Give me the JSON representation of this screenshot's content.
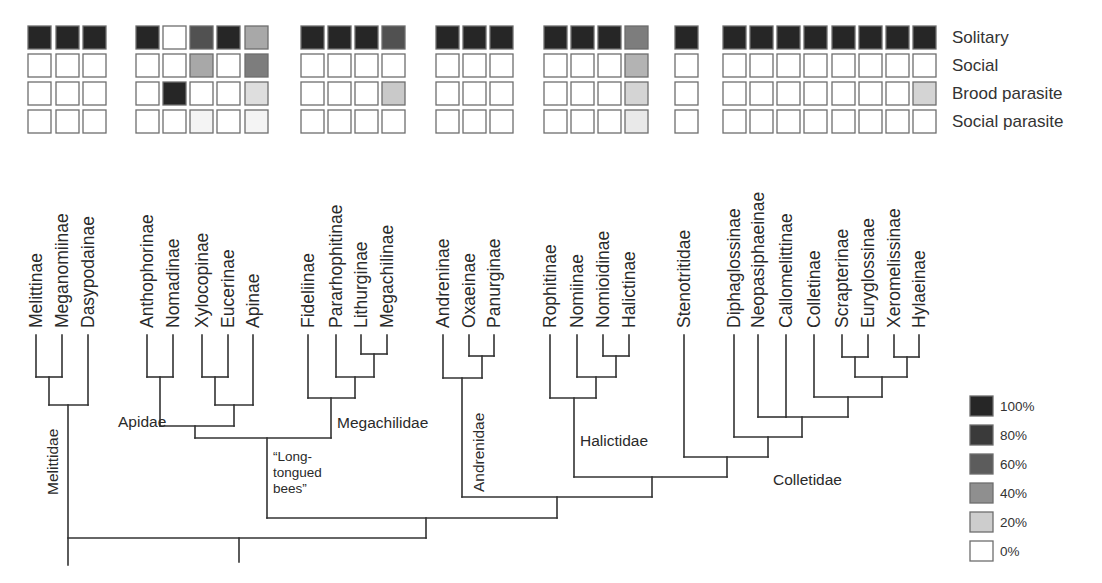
{
  "chart_data": {
    "type": "heatmap",
    "title": "",
    "rows": [
      "Solitary",
      "Social",
      "Brood parasite",
      "Social parasite"
    ],
    "legend": {
      "entries": [
        "100%",
        "80%",
        "60%",
        "40%",
        "20%",
        "0%"
      ],
      "colors": [
        "#262626",
        "#3a3a3a",
        "#5c5c5c",
        "#8f8f8f",
        "#cdcdcd",
        "#ffffff"
      ],
      "position": "bottom-right"
    },
    "columns": [
      {
        "taxon": "Melittinae",
        "family": "Melittidae",
        "values": [
          100,
          0,
          0,
          0
        ]
      },
      {
        "taxon": "Meganomiinae",
        "family": "Melittidae",
        "values": [
          100,
          0,
          0,
          0
        ]
      },
      {
        "taxon": "Dasypodainae",
        "family": "Melittidae",
        "values": [
          100,
          0,
          0,
          0
        ]
      },
      {
        "taxon": "Anthophorinae",
        "family": "Apidae",
        "values": [
          100,
          0,
          0,
          0
        ]
      },
      {
        "taxon": "Nomadinae",
        "family": "Apidae",
        "values": [
          0,
          0,
          100,
          0
        ]
      },
      {
        "taxon": "Xylocopinae",
        "family": "Apidae",
        "values": [
          80,
          40,
          0,
          5
        ]
      },
      {
        "taxon": "Eucerinae",
        "family": "Apidae",
        "values": [
          100,
          0,
          0,
          0
        ]
      },
      {
        "taxon": "Apinae",
        "family": "Apidae",
        "values": [
          40,
          60,
          15,
          5
        ]
      },
      {
        "taxon": "Fideliinae",
        "family": "Megachilidae",
        "values": [
          100,
          0,
          0,
          0
        ]
      },
      {
        "taxon": "Pararhophitinae",
        "family": "Megachilidae",
        "values": [
          100,
          0,
          0,
          0
        ]
      },
      {
        "taxon": "Lithurginae",
        "family": "Megachilidae",
        "values": [
          100,
          0,
          0,
          0
        ]
      },
      {
        "taxon": "Megachilinae",
        "family": "Megachilidae",
        "values": [
          80,
          0,
          25,
          0
        ]
      },
      {
        "taxon": "Andreninae",
        "family": "Andrenidae",
        "values": [
          100,
          0,
          0,
          0
        ]
      },
      {
        "taxon": "Oxaeinae",
        "family": "Andrenidae",
        "values": [
          100,
          0,
          0,
          0
        ]
      },
      {
        "taxon": "Panurginae",
        "family": "Andrenidae",
        "values": [
          100,
          0,
          0,
          0
        ]
      },
      {
        "taxon": "Rophitinae",
        "family": "Halictidae",
        "values": [
          100,
          0,
          0,
          0
        ]
      },
      {
        "taxon": "Nomiinae",
        "family": "Halictidae",
        "values": [
          100,
          0,
          0,
          0
        ]
      },
      {
        "taxon": "Nomioidinae",
        "family": "Halictidae",
        "values": [
          100,
          0,
          0,
          0
        ]
      },
      {
        "taxon": "Halictinae",
        "family": "Halictidae",
        "values": [
          60,
          35,
          20,
          10
        ]
      },
      {
        "taxon": "Stenotritidae",
        "family": "Stenotritidae",
        "values": [
          100,
          0,
          0,
          0
        ]
      },
      {
        "taxon": "Diphaglossinae",
        "family": "Colletidae",
        "values": [
          100,
          0,
          0,
          0
        ]
      },
      {
        "taxon": "Neopasiphaeinae",
        "family": "Colletidae",
        "values": [
          100,
          0,
          0,
          0
        ]
      },
      {
        "taxon": "Callomelittinae",
        "family": "Colletidae",
        "values": [
          100,
          0,
          0,
          0
        ]
      },
      {
        "taxon": "Colletinae",
        "family": "Colletidae",
        "values": [
          100,
          0,
          0,
          0
        ]
      },
      {
        "taxon": "Scrapterinae",
        "family": "Colletidae",
        "values": [
          100,
          0,
          0,
          0
        ]
      },
      {
        "taxon": "Euryglossinae",
        "family": "Colletidae",
        "values": [
          100,
          0,
          0,
          0
        ]
      },
      {
        "taxon": "Xeromelissinae",
        "family": "Colletidae",
        "values": [
          100,
          0,
          0,
          0
        ]
      },
      {
        "taxon": "Hylaeinae",
        "family": "Colletidae",
        "values": [
          100,
          0,
          20,
          0
        ]
      }
    ]
  },
  "layout": {
    "cell_size": 23,
    "row_y": [
      26,
      54,
      82,
      110
    ],
    "col_x": [
      28,
      56,
      83,
      136,
      163,
      190,
      217,
      245,
      301,
      328,
      355,
      382,
      436,
      463,
      490,
      544,
      571,
      598,
      625,
      675,
      723,
      750,
      777,
      804,
      832,
      859,
      886,
      913
    ],
    "tip_x": [
      36,
      62,
      88,
      147,
      173,
      202,
      228,
      253,
      308,
      336,
      361,
      387,
      443,
      469,
      494,
      550,
      577,
      603,
      629,
      684,
      734,
      758,
      786,
      814,
      842,
      868,
      894,
      919
    ],
    "tip_label_bottom_y": 328,
    "tip_top_y": 335,
    "row_label_x": 952
  },
  "tree": {
    "segments": [
      [
        36,
        335,
        36,
        377
      ],
      [
        62,
        335,
        62,
        377
      ],
      [
        36,
        377,
        62,
        377
      ],
      [
        49,
        377,
        49,
        405
      ],
      [
        88,
        335,
        88,
        405
      ],
      [
        49,
        405,
        88,
        405
      ],
      [
        68,
        405,
        68,
        565
      ],
      [
        147,
        335,
        147,
        377
      ],
      [
        173,
        335,
        173,
        377
      ],
      [
        147,
        377,
        173,
        377
      ],
      [
        160,
        377,
        160,
        426
      ],
      [
        202,
        335,
        202,
        377
      ],
      [
        228,
        335,
        228,
        377
      ],
      [
        202,
        377,
        228,
        377
      ],
      [
        215,
        377,
        215,
        405
      ],
      [
        253,
        335,
        253,
        405
      ],
      [
        215,
        405,
        253,
        405
      ],
      [
        234,
        405,
        234,
        426
      ],
      [
        160,
        426,
        234,
        426
      ],
      [
        195,
        426,
        195,
        438
      ],
      [
        308,
        335,
        308,
        398
      ],
      [
        336,
        335,
        336,
        377
      ],
      [
        361,
        335,
        361,
        354
      ],
      [
        387,
        335,
        387,
        354
      ],
      [
        361,
        354,
        387,
        354
      ],
      [
        374,
        354,
        374,
        377
      ],
      [
        336,
        377,
        374,
        377
      ],
      [
        355,
        377,
        355,
        398
      ],
      [
        308,
        398,
        355,
        398
      ],
      [
        331,
        398,
        331,
        438
      ],
      [
        195,
        438,
        331,
        438
      ],
      [
        267,
        438,
        267,
        518
      ],
      [
        443,
        335,
        443,
        378
      ],
      [
        469,
        335,
        469,
        356
      ],
      [
        494,
        335,
        494,
        356
      ],
      [
        469,
        356,
        494,
        356
      ],
      [
        482,
        356,
        482,
        378
      ],
      [
        443,
        378,
        482,
        378
      ],
      [
        462,
        378,
        462,
        497
      ],
      [
        550,
        335,
        550,
        398
      ],
      [
        577,
        335,
        577,
        377
      ],
      [
        603,
        335,
        603,
        356
      ],
      [
        629,
        335,
        629,
        356
      ],
      [
        603,
        356,
        629,
        356
      ],
      [
        616,
        356,
        616,
        377
      ],
      [
        577,
        377,
        616,
        377
      ],
      [
        596,
        377,
        596,
        398
      ],
      [
        550,
        398,
        596,
        398
      ],
      [
        574,
        398,
        574,
        477
      ],
      [
        684,
        335,
        684,
        457
      ],
      [
        734,
        335,
        734,
        437
      ],
      [
        758,
        335,
        758,
        417
      ],
      [
        786,
        335,
        786,
        417
      ],
      [
        758,
        417,
        786,
        417
      ],
      [
        814,
        335,
        814,
        397
      ],
      [
        842,
        335,
        842,
        357
      ],
      [
        868,
        335,
        868,
        357
      ],
      [
        842,
        357,
        868,
        357
      ],
      [
        855,
        357,
        855,
        377
      ],
      [
        894,
        335,
        894,
        357
      ],
      [
        919,
        335,
        919,
        357
      ],
      [
        894,
        357,
        919,
        357
      ],
      [
        907,
        357,
        907,
        377
      ],
      [
        855,
        377,
        907,
        377
      ],
      [
        882,
        377,
        882,
        397
      ],
      [
        814,
        397,
        882,
        397
      ],
      [
        848,
        397,
        848,
        417
      ],
      [
        786,
        417,
        848,
        417
      ],
      [
        802,
        417,
        802,
        437
      ],
      [
        734,
        437,
        802,
        437
      ],
      [
        768,
        437,
        768,
        457
      ],
      [
        684,
        457,
        768,
        457
      ],
      [
        727,
        457,
        727,
        477
      ],
      [
        574,
        477,
        727,
        477
      ],
      [
        652,
        477,
        652,
        497
      ],
      [
        462,
        497,
        652,
        497
      ],
      [
        557,
        497,
        557,
        518
      ],
      [
        267,
        518,
        557,
        518
      ],
      [
        426,
        518,
        426,
        538
      ],
      [
        68,
        538,
        426,
        538
      ],
      [
        239,
        538,
        239,
        562
      ]
    ],
    "clade_labels": [
      {
        "text": "Apidae",
        "x": 118,
        "y": 427,
        "rotate": false
      },
      {
        "text": "Megachilidae",
        "x": 337,
        "y": 428,
        "rotate": false
      },
      {
        "text": "Halictidae",
        "x": 580,
        "y": 446,
        "rotate": false
      },
      {
        "text": "Colletidae",
        "x": 773,
        "y": 485,
        "rotate": false
      },
      {
        "text": "Melittidae",
        "x": 58,
        "y": 495,
        "rotate": true
      },
      {
        "text": "Andrenidae",
        "x": 484,
        "y": 492,
        "rotate": true
      }
    ],
    "long_tongued_label": [
      "“Long-",
      "tongued",
      "bees”"
    ],
    "long_tongued_pos": {
      "x": 273,
      "y": 461,
      "line_height": 16
    }
  }
}
